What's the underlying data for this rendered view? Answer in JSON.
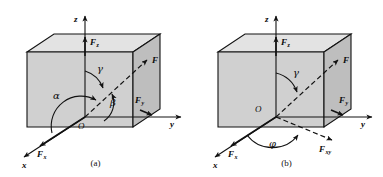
{
  "figure": {
    "background_color": "#ffffff",
    "line_color": "#121212",
    "box_face_front_color": "#cfcfcf",
    "box_face_top_color": "#e2e2e2",
    "box_face_right_color": "#bdbdbd"
  },
  "panels": [
    {
      "id": "a",
      "caption": "(a)",
      "axes": [
        {
          "name": "z-axis",
          "label": "z"
        },
        {
          "name": "y-axis",
          "label": "y"
        },
        {
          "name": "x-axis",
          "label": "x"
        }
      ],
      "origin_label": "O",
      "vectors": [
        {
          "name": "resultant-force",
          "label": "F",
          "sub": "",
          "style": "dashed"
        },
        {
          "name": "force-x-component",
          "label": "F",
          "sub": "x",
          "style": "solid"
        },
        {
          "name": "force-y-component",
          "label": "F",
          "sub": "y",
          "style": "solid"
        },
        {
          "name": "force-z-component",
          "label": "F",
          "sub": "z",
          "style": "solid"
        }
      ],
      "angles": [
        {
          "name": "angle-alpha",
          "label": "α",
          "between": "F and x-axis"
        },
        {
          "name": "angle-beta",
          "label": "β",
          "between": "F and y-axis"
        },
        {
          "name": "angle-gamma",
          "label": "γ",
          "between": "F and z-axis"
        }
      ]
    },
    {
      "id": "b",
      "caption": "(b)",
      "axes": [
        {
          "name": "z-axis",
          "label": "z"
        },
        {
          "name": "y-axis",
          "label": "y"
        },
        {
          "name": "x-axis",
          "label": "x"
        }
      ],
      "origin_label": "O",
      "vectors": [
        {
          "name": "resultant-force",
          "label": "F",
          "sub": "",
          "style": "dashed"
        },
        {
          "name": "force-x-component",
          "label": "F",
          "sub": "x",
          "style": "solid"
        },
        {
          "name": "force-y-component",
          "label": "F",
          "sub": "y",
          "style": "solid"
        },
        {
          "name": "force-z-component",
          "label": "F",
          "sub": "z",
          "style": "solid"
        },
        {
          "name": "force-xy-projection",
          "label": "F",
          "sub": "xy",
          "style": "dashed"
        }
      ],
      "angles": [
        {
          "name": "angle-gamma",
          "label": "γ",
          "between": "F and z-axis"
        },
        {
          "name": "angle-phi",
          "label": "φ",
          "between": "Fxy and x-axis"
        }
      ]
    }
  ]
}
